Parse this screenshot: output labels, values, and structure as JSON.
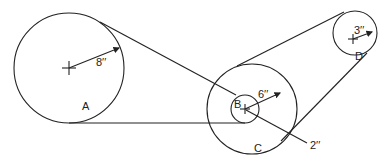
{
  "diagram": {
    "type": "belt-pulley",
    "pulleys": [
      {
        "id": "A",
        "label": "A",
        "radius_label": "8′′"
      },
      {
        "id": "B",
        "label": "B",
        "radius_label": "2′′"
      },
      {
        "id": "C",
        "label": "C",
        "radius_label": "6′′"
      },
      {
        "id": "D",
        "label": "D",
        "radius_label": "3′′"
      }
    ],
    "dims": {
      "a": "8′′",
      "c": "6′′",
      "d": "3′′",
      "b": "2′′"
    },
    "labels": {
      "a": "A",
      "b": "B",
      "c": "C",
      "d": "D"
    }
  }
}
